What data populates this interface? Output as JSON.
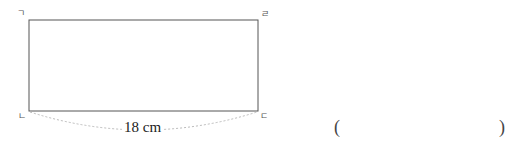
{
  "diagram": {
    "type": "rectangle",
    "vertices": {
      "top_left": "ㄱ",
      "top_right": "ㄹ",
      "bottom_left": "ㄴ",
      "bottom_right": "ㄷ"
    },
    "dimension_label": "18 cm",
    "line_color": "#555555",
    "arc_color": "#bbbbbb"
  },
  "answer": {
    "open_paren": "(",
    "close_paren": ")",
    "value": ""
  }
}
